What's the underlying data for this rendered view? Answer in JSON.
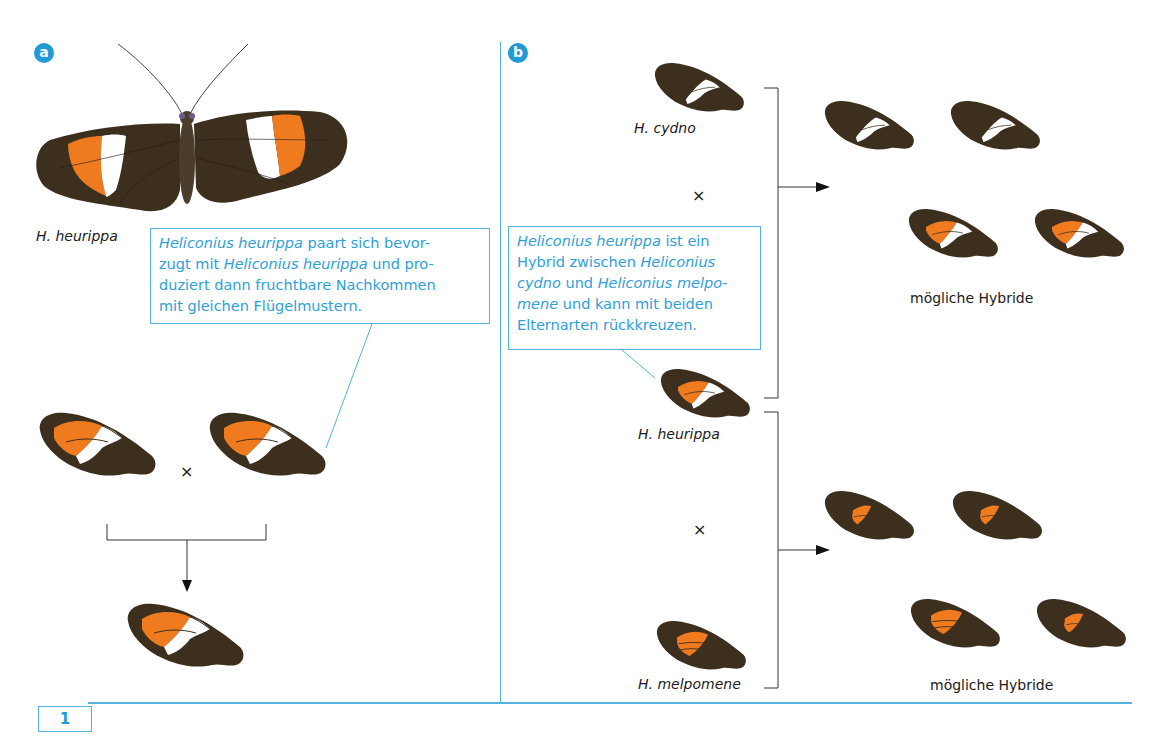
{
  "panel_a": {
    "label": "a",
    "species_label": "H. heurippa",
    "callout": {
      "line1_italic": "Heliconius heurippa",
      "line1_rest": " paart sich bevor-",
      "line2_start": "zugt mit ",
      "line2_italic": "Heliconius heurippa",
      "line2_rest": " und pro-",
      "line3": "duziert dann fruchtbare Nachkommen",
      "line4": "mit gleichen Flügelmustern."
    },
    "cross_symbol": "×"
  },
  "panel_b": {
    "label": "b",
    "species": {
      "cydno": "H. cydno",
      "heurippa": "H. heurippa",
      "melpomene": "H. melpomene"
    },
    "callout": {
      "line1_italic": "Heliconius heurippa",
      "line1_rest": " ist ein",
      "line2_start": "Hybrid zwischen ",
      "line2_italic": "Heliconius",
      "line3_italic": "cydno",
      "line3_mid": " und ",
      "line3_italic2": "Heliconius  melpo-",
      "line4_italic": "mene",
      "line4_rest": " und kann mit beiden",
      "line5": "Elternarten rückkreuzen."
    },
    "cross_symbol": "×",
    "hybrids_label_top": "mögliche Hybride",
    "hybrids_label_bottom": "mögliche Hybride"
  },
  "figure_number": "1",
  "colors": {
    "accent_blue": "#1e9ad6",
    "line_blue": "#55b3dd",
    "wing_brown": "#3d2f1e",
    "wing_orange": "#f07b1f",
    "wing_white": "#ffffff"
  }
}
